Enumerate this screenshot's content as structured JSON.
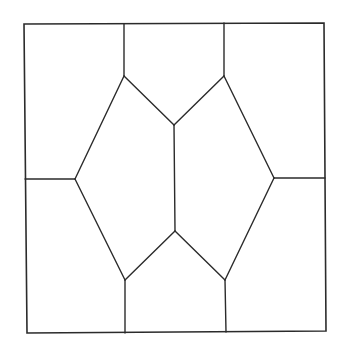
{
  "diagram": {
    "title": "",
    "type": "tiling",
    "colors": {
      "stroke": "#2b2b2b",
      "background": "#ffffff"
    },
    "outer_square": [
      [
        24,
        24
      ],
      [
        324,
        23
      ],
      [
        326,
        331
      ],
      [
        27,
        333
      ]
    ],
    "vertices": {
      "top_left_vertex": [
        124,
        76
      ],
      "top_right_vertex": [
        224,
        76
      ],
      "center_top": [
        174,
        125
      ],
      "center_bottom": [
        175,
        231
      ],
      "left_vertex": [
        75,
        179
      ],
      "right_vertex": [
        274,
        178
      ],
      "bottom_left_vertex": [
        125,
        280
      ],
      "bottom_right_vertex": [
        225,
        280
      ]
    },
    "edges": [
      {
        "id": "top-left-vertical",
        "from": [
          124,
          24
        ],
        "to": [
          124,
          76
        ]
      },
      {
        "id": "top-right-vertical",
        "from": [
          224,
          23
        ],
        "to": [
          224,
          76
        ]
      },
      {
        "id": "upper-left-diagonal",
        "from": [
          124,
          76
        ],
        "to": [
          174,
          125
        ]
      },
      {
        "id": "upper-right-diagonal",
        "from": [
          224,
          76
        ],
        "to": [
          174,
          125
        ]
      },
      {
        "id": "center-vertical",
        "from": [
          174,
          125
        ],
        "to": [
          175,
          231
        ]
      },
      {
        "id": "left-upper-slant",
        "from": [
          124,
          76
        ],
        "to": [
          75,
          179
        ]
      },
      {
        "id": "right-upper-slant",
        "from": [
          224,
          76
        ],
        "to": [
          274,
          178
        ]
      },
      {
        "id": "left-horizontal",
        "from": [
          25,
          179
        ],
        "to": [
          75,
          179
        ]
      },
      {
        "id": "right-horizontal",
        "from": [
          274,
          178
        ],
        "to": [
          325,
          178
        ]
      },
      {
        "id": "left-lower-slant",
        "from": [
          75,
          179
        ],
        "to": [
          125,
          280
        ]
      },
      {
        "id": "right-lower-slant",
        "from": [
          274,
          178
        ],
        "to": [
          225,
          280
        ]
      },
      {
        "id": "lower-left-diagonal",
        "from": [
          125,
          280
        ],
        "to": [
          175,
          231
        ]
      },
      {
        "id": "lower-right-diagonal",
        "from": [
          225,
          280
        ],
        "to": [
          175,
          231
        ]
      },
      {
        "id": "bottom-left-vertical",
        "from": [
          125,
          280
        ],
        "to": [
          125,
          333
        ]
      },
      {
        "id": "bottom-right-vertical",
        "from": [
          225,
          280
        ],
        "to": [
          226,
          332
        ]
      }
    ],
    "region_count": 10
  }
}
